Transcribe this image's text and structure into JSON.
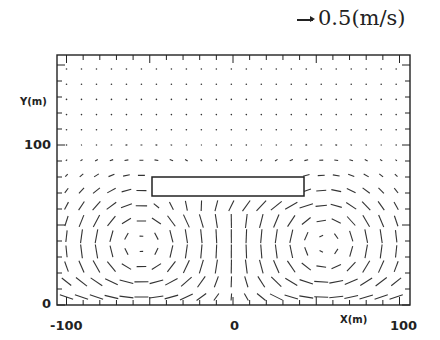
{
  "chart_data": {
    "type": "vector-field",
    "title": "",
    "xlabel": "X(m)",
    "ylabel": "Y(m)",
    "xlim": [
      -105,
      107
    ],
    "ylim": [
      0,
      156
    ],
    "x_ticks": [
      -100,
      0,
      100
    ],
    "y_ticks": [
      0,
      100
    ],
    "x_tick_labels": [
      "-100",
      "0",
      "100"
    ],
    "y_tick_labels": [
      "0",
      "100"
    ],
    "scale_reference": {
      "value": 0.5,
      "unit": "m/s",
      "label": "0.5(m/s)"
    },
    "obstacle": {
      "type": "rectangle",
      "x_range": [
        -50,
        42
      ],
      "y_range": [
        68,
        80
      ]
    },
    "flow_features": [
      {
        "type": "vortex",
        "center": [
          -55,
          38
        ],
        "rotation": "clockwise"
      },
      {
        "type": "vortex",
        "center": [
          55,
          38
        ],
        "rotation": "counterclockwise"
      },
      {
        "type": "near-ground jet",
        "y": 5,
        "direction": "outward from center"
      }
    ],
    "grid": false,
    "legend": null
  },
  "figure": {
    "scale_text": "0.5(m/s)",
    "xlabel": "X(m)",
    "ylabel": "Y(m)",
    "x_tick_labels": [
      "-100",
      "0",
      "100"
    ],
    "y_tick_labels": [
      "0",
      "100"
    ]
  }
}
